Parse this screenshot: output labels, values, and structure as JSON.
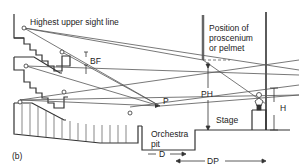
{
  "figure": {
    "panel_label": "(b)",
    "labels": {
      "highest_sight_line": "Highest upper sight line",
      "proscenium_line1": "Position of",
      "proscenium_line2": "proscenium",
      "proscenium_line3": "or pelmet",
      "bf": "BF",
      "ph": "PH",
      "p": "P",
      "stage": "Stage",
      "h": "H",
      "orchestra_line1": "Orchestra",
      "orchestra_line2": "pit",
      "d": "D",
      "dp": "DP"
    },
    "colors": {
      "line": "#333333",
      "sightline": "#555555",
      "background": "#ffffff"
    }
  }
}
